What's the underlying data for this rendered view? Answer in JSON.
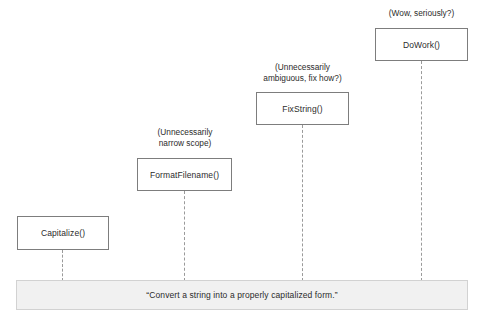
{
  "diagram": {
    "colors": {
      "background": "#ffffff",
      "box_border": "#7d7d7d",
      "box_fill": "#ffffff",
      "connector": "#9a9a9a",
      "bar_fill": "#f1f1f1",
      "bar_border": "#d2d2d2",
      "text": "#2b2b2b"
    },
    "nodes": [
      {
        "id": "capitalize",
        "label": "Capitalize()",
        "annotation": "",
        "x": 17,
        "y": 216,
        "width": 92,
        "height": 34,
        "connector_x": 62,
        "connector_top": 250,
        "connector_bottom": 281
      },
      {
        "id": "format-filename",
        "label": "FormatFilename()",
        "annotation": "(Unnecessarily\nnarrow scope)",
        "annotation_x": 139,
        "annotation_y": 127,
        "annotation_width": 92,
        "x": 137,
        "y": 158,
        "width": 95,
        "height": 33,
        "connector_x": 184,
        "connector_top": 191,
        "connector_bottom": 281
      },
      {
        "id": "fix-string",
        "label": "FixString()",
        "annotation": "(Unnecessarily\nambiguous, fix how?)",
        "annotation_x": 253,
        "annotation_y": 62,
        "annotation_width": 99,
        "x": 256,
        "y": 92,
        "width": 93,
        "height": 33,
        "connector_x": 302,
        "connector_top": 125,
        "connector_bottom": 281
      },
      {
        "id": "do-work",
        "label": "DoWork()",
        "annotation": "(Wow, seriously?)",
        "annotation_x": 375,
        "annotation_y": 8,
        "annotation_width": 93,
        "x": 375,
        "y": 28,
        "width": 93,
        "height": 33,
        "connector_x": 421,
        "connector_top": 61,
        "connector_bottom": 281
      }
    ],
    "description_bar": {
      "text": "“Convert a string into a properly capitalized form.”",
      "x": 16,
      "y": 280,
      "width": 452,
      "height": 30
    }
  }
}
